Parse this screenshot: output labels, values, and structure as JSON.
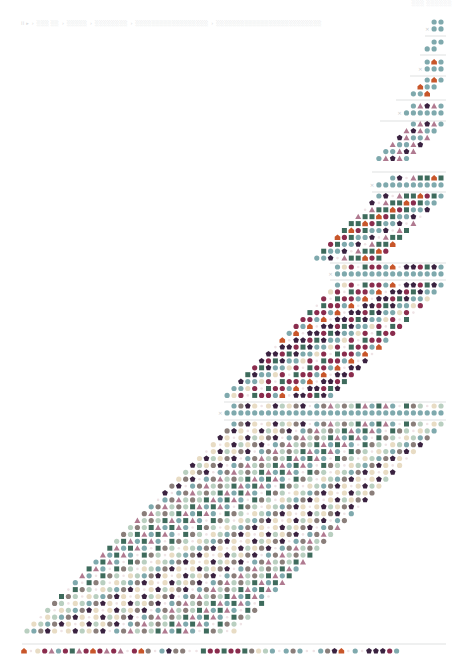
{
  "header": {
    "breadcrumb": [
      "II ▸",
      "░░░ ░░",
      "░░░░░",
      "░░░░░░░░",
      "░░░░░░░░░░░░░░░░░░",
      "░░░░░░░░░░░░░░░░░░░░░░░░░░"
    ],
    "separator": "›",
    "corner_label": "░░░ ░░░░░░"
  },
  "chart_data": {
    "type": "glyph-matrix",
    "title": "",
    "xlabel": "",
    "ylabel": "",
    "grid": false,
    "legend": "none",
    "palette": {
      "t": "#7fa9ad",
      "p": "#3a2240",
      "m": "#8a2c4d",
      "o": "#c8562a",
      "g": "#3e6b5c",
      "a": "#b07a90",
      "s": "#b9cfc0",
      "c": "#e8dcc4",
      "b": "#8a7e7a",
      "w": "#efe4e6"
    },
    "glyph_legend": {
      "t": "circle",
      "p": "pentagon",
      "m": "circle",
      "o": "house",
      "g": "square",
      "a": "triangle",
      "s": "circle",
      "c": "circle",
      "b": "circle",
      "w": "dot"
    },
    "pitch": 6.9,
    "separator_color": "#c9cccd",
    "blocks": [
      {
        "kind": "header",
        "y": 22,
        "x_right": 441,
        "top": "tt",
        "base_count": 2,
        "sep_y": 36,
        "sep_x": [
          425,
          446
        ]
      },
      {
        "kind": "stair",
        "y": 42,
        "rows": 2,
        "x_right": 441,
        "shift": 6.9,
        "pattern": "tt",
        "width_growth": 0,
        "sep_y": 55,
        "sep_x": [
          420,
          446
        ]
      },
      {
        "kind": "header",
        "y": 62,
        "x_right": 441,
        "top": "tot",
        "base_count": 3,
        "sep_y": 76,
        "sep_x": [
          410,
          446
        ]
      },
      {
        "kind": "stair",
        "y": 80,
        "rows": 3,
        "x_right": 441,
        "shift": 6.9,
        "pattern": "tot",
        "width_growth": 0,
        "sep_y": 100,
        "sep_x": [
          396,
          446
        ]
      },
      {
        "kind": "header",
        "y": 106,
        "x_right": 441,
        "top": "tapat",
        "base_count": 6,
        "sep_y": 121,
        "sep_x": [
          380,
          446
        ]
      },
      {
        "kind": "stair",
        "y": 124,
        "rows": 6,
        "x_right": 441,
        "shift": 6.9,
        "pattern": "tapat",
        "width_growth": 0,
        "sep_y": 172,
        "sep_x": [
          372,
          446
        ]
      },
      {
        "kind": "header",
        "y": 178,
        "x_right": 441,
        "top": "tpwaggog",
        "base_count": 10,
        "sep_y": 192,
        "sep_x": [
          372,
          446
        ]
      },
      {
        "kind": "stair",
        "y": 196,
        "rows": 10,
        "x_right": 441,
        "shift": 6.9,
        "pattern": "tpwaggomgt",
        "width_growth": 0,
        "sep_y": 263,
        "sep_x": [
          330,
          446
        ]
      },
      {
        "kind": "header",
        "y": 267,
        "x_right": 441,
        "top": "tcmwgmmtowppmgpt",
        "base_count": 16,
        "sep_y": 280,
        "sep_x": [
          330,
          446
        ]
      },
      {
        "kind": "stair",
        "y": 285,
        "rows": 17,
        "x_right": 441,
        "shift": 6.9,
        "pattern": "tcmwgmmtowppmgpt",
        "width_growth": 0,
        "sep_y": 402,
        "sep_x": [
          224,
          446
        ]
      },
      {
        "kind": "header",
        "y": 406,
        "x_right": 441,
        "top": "tbpcwcpscbpwtbasbsgatgatwgbswcs",
        "base_count": 32,
        "sep_y": 420,
        "sep_x": [
          224,
          446
        ]
      },
      {
        "kind": "stair",
        "y": 424,
        "rows": 31,
        "x_right": 441,
        "shift": 6.9,
        "pattern": "tbpcwcpscbpwtbasbsgatgatwgbswcs",
        "width_growth": 0,
        "sep_y": 644,
        "sep_x": [
          22,
          446
        ]
      },
      {
        "kind": "final",
        "y": 651,
        "x_left": 24,
        "top": "owcmatmgamomamawmobwtpbbwwgmmgmmgbcstwtbtwwtbpowtwpppmt"
      }
    ]
  }
}
